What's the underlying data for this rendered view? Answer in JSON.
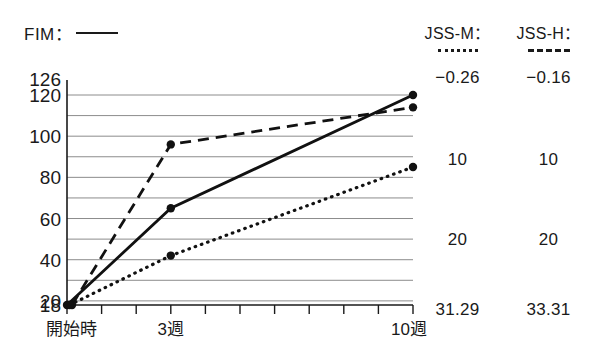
{
  "legend": {
    "left": {
      "label": "FIM：",
      "style": "solid-line"
    },
    "right": [
      {
        "label": "JSS-M：",
        "style": "dotted-line"
      },
      {
        "label": "JSS-H：",
        "style": "dashed-line"
      }
    ]
  },
  "axis": {
    "y_ticks": [
      "126",
      "120",
      "100",
      "80",
      "60",
      "40",
      "20",
      "18"
    ],
    "x_ticks": [
      "開始時",
      "3週",
      "10週"
    ]
  },
  "stats": {
    "rows": [
      {
        "jss_m": "−0.26",
        "jss_h": "−0.16"
      },
      {
        "jss_m": "10",
        "jss_h": "10"
      },
      {
        "jss_m": "20",
        "jss_h": "20"
      },
      {
        "jss_m": "31.29",
        "jss_h": "33.31"
      }
    ]
  },
  "chart_data": {
    "type": "line",
    "title": "",
    "xlabel": "",
    "ylabel": "",
    "categories": [
      "開始時",
      "3週",
      "10週"
    ],
    "x": [
      0,
      3,
      10
    ],
    "xlim": [
      0,
      10
    ],
    "ylim": [
      18,
      126
    ],
    "grid": true,
    "grid_values": [
      20,
      30,
      40,
      50,
      60,
      70,
      80,
      90,
      100,
      110,
      120
    ],
    "y_tick_labels": [
      126,
      120,
      100,
      80,
      60,
      40,
      20,
      18
    ],
    "legend_position": "top",
    "series": [
      {
        "name": "FIM",
        "style": "solid",
        "values": [
          18,
          65,
          120
        ]
      },
      {
        "name": "JSS-H",
        "style": "dashed",
        "values": [
          18,
          96,
          114
        ]
      },
      {
        "name": "JSS-M",
        "style": "dotted",
        "values": [
          18,
          42,
          85
        ]
      }
    ]
  }
}
